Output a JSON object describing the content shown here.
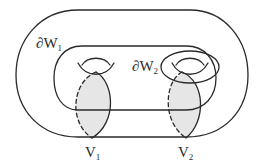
{
  "diagram": {
    "type": "topology-surface",
    "colors": {
      "stroke": "#2a2a2a",
      "disk_fill": "#e6e6e6",
      "background": "#ffffff"
    },
    "labels": {
      "dW1": {
        "symbol": "∂W",
        "sub": "1"
      },
      "dW2": {
        "symbol": "∂W",
        "sub": "2"
      },
      "V1": {
        "symbol": "V",
        "sub": "1"
      },
      "V2": {
        "symbol": "V",
        "sub": "2"
      }
    },
    "elements": [
      {
        "id": "outer-surface-curve",
        "label": "∂W1"
      },
      {
        "id": "inner-surface-curve"
      },
      {
        "id": "handle-1"
      },
      {
        "id": "handle-2"
      },
      {
        "id": "dW2-curve",
        "label": "∂W2"
      },
      {
        "id": "meridian-disk-1",
        "label": "V1"
      },
      {
        "id": "meridian-disk-2",
        "label": "V2"
      }
    ]
  }
}
